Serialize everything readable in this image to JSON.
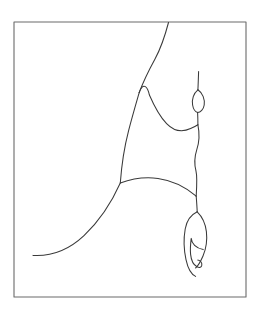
{
  "document": {
    "title": "Untitled line drawing",
    "medium": "pen-and-ink contour drawing",
    "width": 261,
    "height": 317
  },
  "canvas": {
    "background_color": "#ffffff",
    "paper_tone": "#ffffff"
  },
  "frame": {
    "name": "rectangular border",
    "stroke_color": "#6b6b6b",
    "stroke_width": 1.1,
    "x": 14,
    "y": 22,
    "width": 232,
    "height": 275
  },
  "ink": {
    "stroke_color": "#3a3a3a",
    "stroke_width": 1.05,
    "secondary_stroke_color": "#4a4a4a"
  },
  "strokes": [
    {
      "name": "upper-sweeping-stem",
      "description": "long curve entering from the top border and descending to the figure's shoulder notch",
      "path": "M 168.5 22.5 C 165.5 34 161.5 47 155 59 C 149 70 143.5 81 139.2 92.6"
    },
    {
      "name": "shoulder-notch",
      "description": "small V notch at the top of the torso",
      "path": "M 139.2 92.6 C 140.4 87.8 143.0 85.2 145.4 86.6 C 147.6 88.0 148.6 91.4 149.4 95.0"
    },
    {
      "name": "right-shoulder-slope",
      "description": "diagonal from the notch down to the hollow of the arm",
      "path": "M 149.4 95.0 C 154.6 107.0 160.0 116.8 166.6 123.6 C 173.6 130.8 182.4 132.4 190.6 128.6 C 194.4 126.8 196.6 125.6 197.9 124.8"
    },
    {
      "name": "left-torso-contour",
      "description": "long concave left edge of the torso falling from the notch to the hip",
      "path": "M 139.2 92.6 C 136.2 103.0 132.4 116.0 128.6 130.6 C 124.6 146.0 121.6 165.0 120.3 183.0"
    },
    {
      "name": "hip-arc",
      "description": "arc across the hips from the left contour to the right edge",
      "path": "M 120.3 183.0 C 132.0 178.6 146.0 176.8 158.0 178.4 C 172.4 180.4 186.0 187.2 196.2 196.2"
    },
    {
      "name": "lower-sweeping-tail",
      "description": "long S-curve sweeping from the hip down and out to the lower left",
      "path": "M 120.3 183.0 C 112.0 201.6 100.0 220.4 84.0 235.6 C 68.0 250.6 50.0 256.4 33.0 255.4"
    },
    {
      "name": "vertical-stem-upper",
      "description": "thin vertical stem rising above the oval bud",
      "path": "M 198.6 71.5 C 198.4 77.5 198.2 84.0 197.9 89.8"
    },
    {
      "name": "oval-bud-left",
      "description": "left side of the small pointed oval (bud / head) on the stem",
      "path": "M 197.9 89.8 C 193.6 93.2 191.6 99.4 192.6 105.0 C 193.3 109.2 195.4 111.8 197.6 112.4"
    },
    {
      "name": "oval-bud-right",
      "description": "right side of the small pointed oval (bud / head) on the stem",
      "path": "M 197.9 89.8 C 202.6 93.0 205.0 99.2 204.2 105.0 C 203.6 109.4 200.4 112.2 197.6 112.4"
    },
    {
      "name": "stem-below-bud",
      "description": "stem continuing from the bud down to the arm junction",
      "path": "M 197.6 112.4 C 197.8 116.4 197.9 120.6 197.9 124.8"
    },
    {
      "name": "right-body-edge",
      "description": "slightly wavy right contour from the arm junction down past the waist to the hip",
      "path": "M 197.9 124.8 C 199.6 133.0 199.4 141.6 196.8 149.6 C 194.4 157.0 194.2 164.2 196.0 171.2 C 197.2 176.0 197.0 183.0 196.2 196.2"
    },
    {
      "name": "pendant-connector",
      "description": "short link from the hip down to the hanging pendant",
      "path": "M 196.2 196.2 C 196.6 201.2 197.0 206.6 197.2 211.8"
    },
    {
      "name": "pendant-outer-left",
      "description": "outer left contour of the hanging leaf-shaped pendant",
      "path": "M 197.2 211.8 C 191.0 214.8 186.6 221.0 185.2 229.0 C 183.4 239.2 184.0 250.4 186.0 259.6 C 187.8 268.0 191.4 274.4 195.6 276.4"
    },
    {
      "name": "pendant-outer-right",
      "description": "outer right contour of the hanging leaf-shaped pendant",
      "path": "M 197.2 211.8 C 202.0 216.4 205.4 223.4 206.4 231.6 C 207.4 240.4 206.0 249.0 203.0 256.0 C 200.4 262.0 197.4 266.4 195.6 268.0"
    },
    {
      "name": "pendant-inner-curl",
      "description": "inner hook curl inside the pendant, ending in a small spiral",
      "path": "M 203.2 249.6 C 200.2 249.0 197.0 247.8 194.6 245.4 C 192.6 243.4 191.4 241.0 191.2 238.4 C 190.6 243.4 190.0 249.0 190.6 254.4 C 191.2 260.2 193.6 265.0 197.0 266.8 C 199.6 268.2 201.4 267.4 201.8 265.2 C 202.2 262.6 200.4 260.4 197.8 260.0"
    }
  ]
}
